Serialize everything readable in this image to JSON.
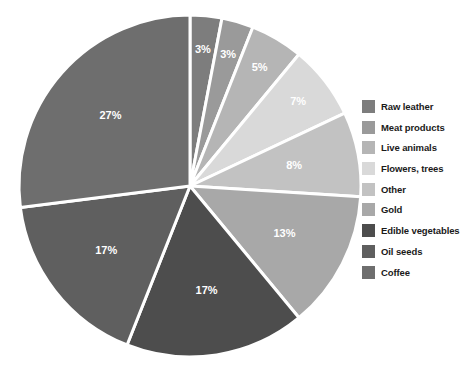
{
  "chart_data": {
    "type": "pie",
    "title": "",
    "subtitle": "",
    "xlabel": "",
    "ylabel": "",
    "legend_position": "right",
    "grid": false,
    "categories": [
      "Raw leather",
      "Meat products",
      "Live animals",
      "Flowers, trees",
      "Other",
      "Gold",
      "Edible vegetables",
      "Oil seeds",
      "Coffee"
    ],
    "values": [
      3,
      3,
      5,
      7,
      8,
      13,
      17,
      17,
      27
    ],
    "value_labels": [
      "3%",
      "3%",
      "5%",
      "7%",
      "8%",
      "13%",
      "17%",
      "17%",
      "27%"
    ],
    "colors": [
      "#7d7d7d",
      "#9a9a9a",
      "#b5b5b5",
      "#d9d9d9",
      "#c2c2c2",
      "#a8a8a8",
      "#4d4d4d",
      "#5f5f5f",
      "#6e6e6e"
    ],
    "slice_gap_color": "#ffffff",
    "start_angle_deg": 0,
    "direction": "clockwise",
    "units": "percent",
    "total": 100
  },
  "legend": {
    "items": [
      {
        "label": "Raw leather",
        "color": "#7d7d7d",
        "value": "3%"
      },
      {
        "label": "Meat products",
        "color": "#9a9a9a",
        "value": "3%"
      },
      {
        "label": "Live animals",
        "color": "#b5b5b5",
        "value": "5%"
      },
      {
        "label": "Flowers, trees",
        "color": "#d9d9d9",
        "value": "7%"
      },
      {
        "label": "Other",
        "color": "#c2c2c2",
        "value": "8%"
      },
      {
        "label": "Gold",
        "color": "#a8a8a8",
        "value": "13%"
      },
      {
        "label": "Edible vegetables",
        "color": "#4d4d4d",
        "value": "17%"
      },
      {
        "label": "Oil seeds",
        "color": "#5f5f5f",
        "value": "17%"
      },
      {
        "label": "Coffee",
        "color": "#6e6e6e",
        "value": "27%"
      }
    ]
  }
}
